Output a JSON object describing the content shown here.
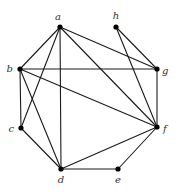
{
  "diagram": {
    "type": "undirected-graph",
    "nodes": [
      {
        "id": "a",
        "label": "a",
        "x": 60,
        "y": 27,
        "lx": 58,
        "ly": 20,
        "anchor": "middle"
      },
      {
        "id": "h",
        "label": "h",
        "x": 116,
        "y": 27,
        "lx": 116,
        "ly": 19,
        "anchor": "middle"
      },
      {
        "id": "b",
        "label": "b",
        "x": 20,
        "y": 69,
        "lx": 13,
        "ly": 72,
        "anchor": "end"
      },
      {
        "id": "g",
        "label": "g",
        "x": 157,
        "y": 69,
        "lx": 162,
        "ly": 74,
        "anchor": "start"
      },
      {
        "id": "c",
        "label": "c",
        "x": 21,
        "y": 128,
        "lx": 14,
        "ly": 132,
        "anchor": "end"
      },
      {
        "id": "f",
        "label": "f",
        "x": 157,
        "y": 127,
        "lx": 163,
        "ly": 132,
        "anchor": "start"
      },
      {
        "id": "d",
        "label": "d",
        "x": 61,
        "y": 169,
        "lx": 61,
        "ly": 183,
        "anchor": "middle"
      },
      {
        "id": "e",
        "label": "e",
        "x": 118,
        "y": 169,
        "lx": 118,
        "ly": 183,
        "anchor": "middle"
      }
    ],
    "edges": [
      [
        "a",
        "b"
      ],
      [
        "a",
        "c"
      ],
      [
        "a",
        "d"
      ],
      [
        "a",
        "f"
      ],
      [
        "a",
        "g"
      ],
      [
        "b",
        "c"
      ],
      [
        "b",
        "d"
      ],
      [
        "b",
        "f"
      ],
      [
        "b",
        "g"
      ],
      [
        "c",
        "d"
      ],
      [
        "d",
        "e"
      ],
      [
        "d",
        "f"
      ],
      [
        "e",
        "f"
      ],
      [
        "f",
        "g"
      ],
      [
        "f",
        "h"
      ],
      [
        "g",
        "h"
      ]
    ],
    "colors": {
      "edge": "#1a1a1a",
      "node": "#000000",
      "label": "#333333",
      "background": "#ffffff"
    }
  }
}
